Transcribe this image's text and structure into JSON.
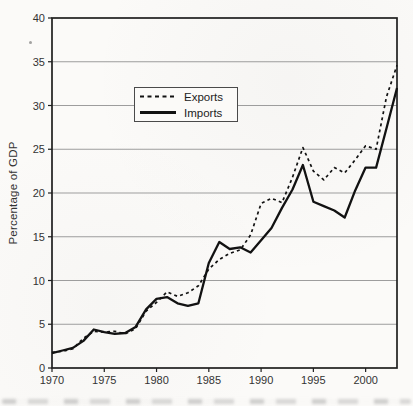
{
  "chart_data": {
    "type": "line",
    "title": "",
    "xlabel": "",
    "ylabel": "Percentage of GDP",
    "x": [
      1970,
      1971,
      1972,
      1973,
      1974,
      1975,
      1976,
      1977,
      1978,
      1979,
      1980,
      1981,
      1982,
      1983,
      1984,
      1985,
      1986,
      1987,
      1988,
      1989,
      1990,
      1991,
      1992,
      1993,
      1994,
      1995,
      1996,
      1997,
      1998,
      1999,
      2000,
      2001,
      2002,
      2003
    ],
    "series": [
      {
        "name": "Exports",
        "style": "dashed",
        "values": [
          1.8,
          1.9,
          2.2,
          3.4,
          4.2,
          4.1,
          4.2,
          3.9,
          4.5,
          6.5,
          7.5,
          8.7,
          8.2,
          8.6,
          9.4,
          11.3,
          12.4,
          13.1,
          13.5,
          15.2,
          18.8,
          19.4,
          18.9,
          21.8,
          25.2,
          22.5,
          21.5,
          22.9,
          22.3,
          23.8,
          25.4,
          25.0,
          31.0,
          34.6
        ]
      },
      {
        "name": "Imports",
        "style": "solid",
        "values": [
          1.7,
          2.0,
          2.3,
          3.1,
          4.4,
          4.1,
          3.9,
          4.0,
          4.7,
          6.7,
          7.9,
          8.1,
          7.4,
          7.1,
          7.4,
          12.0,
          14.4,
          13.6,
          13.8,
          13.2,
          14.6,
          16.0,
          18.3,
          20.4,
          23.2,
          19.0,
          18.5,
          18.0,
          17.2,
          20.3,
          22.9,
          22.9,
          27.4,
          32.0
        ]
      }
    ],
    "xlim": [
      1970,
      2003
    ],
    "ylim": [
      0,
      40
    ],
    "xticks": [
      1970,
      1975,
      1980,
      1985,
      1990,
      1995,
      2000
    ],
    "yticks": [
      0,
      5,
      10,
      15,
      20,
      25,
      30,
      35,
      40
    ],
    "grid": "horizontal",
    "legend_position": "upper-left-inside"
  },
  "colors": {
    "line": "#121212",
    "grid": "#9d9d9d",
    "frame": "#1f1f1f",
    "text": "#333333",
    "background": "#fbfaf8"
  }
}
